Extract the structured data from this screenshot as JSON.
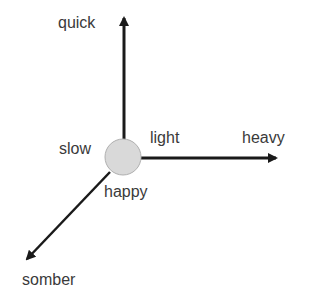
{
  "diagram": {
    "origin": {
      "shape": "circle",
      "fill": "#d9d9d9",
      "stroke": "#b0b0b0"
    },
    "axes": [
      {
        "direction": "up",
        "negative_label": "slow",
        "positive_label": "quick"
      },
      {
        "direction": "right",
        "negative_label": "light",
        "positive_label": "heavy"
      },
      {
        "direction": "down-left",
        "negative_label": "happy",
        "positive_label": "somber"
      }
    ],
    "labels": {
      "quick": "quick",
      "slow": "slow",
      "light": "light",
      "heavy": "heavy",
      "happy": "happy",
      "somber": "somber"
    },
    "colors": {
      "arrow": "#1a1a1a",
      "text": "#3a3a3a",
      "background": "#ffffff"
    }
  }
}
